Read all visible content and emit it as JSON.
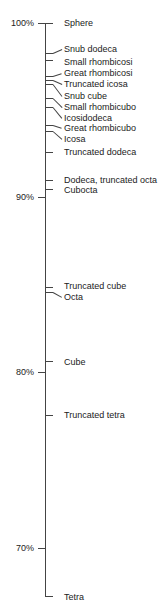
{
  "chart_data": {
    "type": "scatter",
    "title": "",
    "xlabel": "",
    "ylabel": "",
    "ylim": [
      67,
      100
    ],
    "yticks": [
      {
        "value": 100,
        "label": "100%"
      },
      {
        "value": 90,
        "label": "90%"
      },
      {
        "value": 80,
        "label": "80%"
      },
      {
        "value": 70,
        "label": "70%"
      }
    ],
    "grid": false,
    "points": [
      {
        "label": "Sphere",
        "value": 100.0
      },
      {
        "label": "Snub dodeca",
        "value": 98.3
      },
      {
        "label": "Small rhombicosi",
        "value": 97.9
      },
      {
        "label": "Great rhombicosi",
        "value": 97.0
      },
      {
        "label": "Truncated icosa",
        "value": 96.7
      },
      {
        "label": "Snub cube",
        "value": 96.5
      },
      {
        "label": "Small rhombicubo",
        "value": 95.7
      },
      {
        "label": "Icosidodeca",
        "value": 95.2
      },
      {
        "label": "Great rhombicubo",
        "value": 94.2
      },
      {
        "label": "Icosa",
        "value": 93.9
      },
      {
        "label": "Truncated dodeca",
        "value": 92.6
      },
      {
        "label": "Dodeca, truncated octa",
        "value": 91.0
      },
      {
        "label": "Cubocta",
        "value": 90.5
      },
      {
        "label": "Truncated cube",
        "value": 84.9
      },
      {
        "label": "Octa",
        "value": 84.6
      },
      {
        "label": "Cube",
        "value": 80.6
      },
      {
        "label": "Truncated tetra",
        "value": 77.5
      },
      {
        "label": "Tetra",
        "value": 67.3
      }
    ]
  },
  "layout_labels": [
    {
      "label": "Sphere",
      "tick_y": 23,
      "text_y": 18
    },
    {
      "label": "Snub dodeca",
      "tick_y": 53,
      "text_y": 44
    },
    {
      "label": "Small rhombicosi",
      "tick_y": 60,
      "text_y": 57
    },
    {
      "label": "Great rhombicosi",
      "tick_y": 76,
      "text_y": 68
    },
    {
      "label": "Truncated icosa",
      "tick_y": 80,
      "text_y": 79
    },
    {
      "label": "Snub cube",
      "tick_y": 84,
      "text_y": 91
    },
    {
      "label": "Small rhombicubo",
      "tick_y": 98,
      "text_y": 102
    },
    {
      "label": "Icosidodeca",
      "tick_y": 107,
      "text_y": 113
    },
    {
      "label": "Great rhombicubo",
      "tick_y": 125,
      "text_y": 123
    },
    {
      "label": "Icosa",
      "tick_y": 131,
      "text_y": 134
    },
    {
      "label": "Truncated dodeca",
      "tick_y": 152,
      "text_y": 147
    },
    {
      "label": "Dodeca, truncated octa",
      "tick_y": 180,
      "text_y": 175
    },
    {
      "label": "Cubocta",
      "tick_y": 189,
      "text_y": 185
    },
    {
      "label": "Truncated cube",
      "tick_y": 287,
      "text_y": 281
    },
    {
      "label": "Octa",
      "tick_y": 292,
      "text_y": 292
    },
    {
      "label": "Cube",
      "tick_y": 361,
      "text_y": 357
    },
    {
      "label": "Truncated tetra",
      "tick_y": 415,
      "text_y": 410
    },
    {
      "label": "Tetra",
      "tick_y": 596,
      "text_y": 592
    }
  ]
}
